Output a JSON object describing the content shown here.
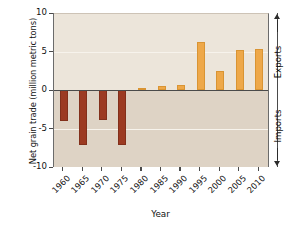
{
  "chart_data": {
    "type": "bar",
    "title": "",
    "xlabel": "Year",
    "ylabel": "Net grain trade (million metric tons)",
    "categories": [
      "1960",
      "1965",
      "1970",
      "1975",
      "1980",
      "1985",
      "1990",
      "1995",
      "2000",
      "2005",
      "2010"
    ],
    "values": [
      -4.0,
      -7.1,
      -3.9,
      -7.1,
      0.3,
      0.5,
      0.6,
      6.2,
      2.5,
      5.2,
      5.3
    ],
    "ylim": [
      -10,
      10
    ],
    "yticks": [
      "10",
      "5",
      "0",
      "-5",
      "-10"
    ],
    "ytick_values": [
      10,
      5,
      0,
      -5,
      -10
    ],
    "grid": true,
    "gridlines_at": [
      5,
      -5
    ],
    "legend": "none",
    "colors": {
      "positive_bar": "#eea849",
      "negative_bar": "#9c3a22",
      "plot_background_upper": "#ece5da",
      "plot_background_lower": "#ded3c5",
      "axis": "#4a4a4a",
      "gridline": "#f7f3ec"
    },
    "annotations": {
      "upper_direction": "Exports",
      "lower_direction": "Imports"
    }
  },
  "axis": {
    "y_title": "Net grain trade (million metric tons)",
    "x_title": "Year"
  },
  "side": {
    "exports_label": "Exports",
    "imports_label": "Imports"
  }
}
